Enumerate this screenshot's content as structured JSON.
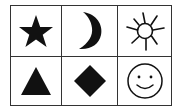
{
  "grid": {
    "rows": 2,
    "columns": 3,
    "border_color": "#333333",
    "cells": [
      {
        "row": 0,
        "col": 0,
        "symbol": "star",
        "style": "filled"
      },
      {
        "row": 0,
        "col": 1,
        "symbol": "crescent-moon",
        "style": "filled"
      },
      {
        "row": 0,
        "col": 2,
        "symbol": "sun",
        "style": "outline"
      },
      {
        "row": 1,
        "col": 0,
        "symbol": "triangle",
        "style": "filled"
      },
      {
        "row": 1,
        "col": 1,
        "symbol": "diamond",
        "style": "filled"
      },
      {
        "row": 1,
        "col": 2,
        "symbol": "smiley-face",
        "style": "outline"
      }
    ],
    "symbol_color": "#111111"
  }
}
